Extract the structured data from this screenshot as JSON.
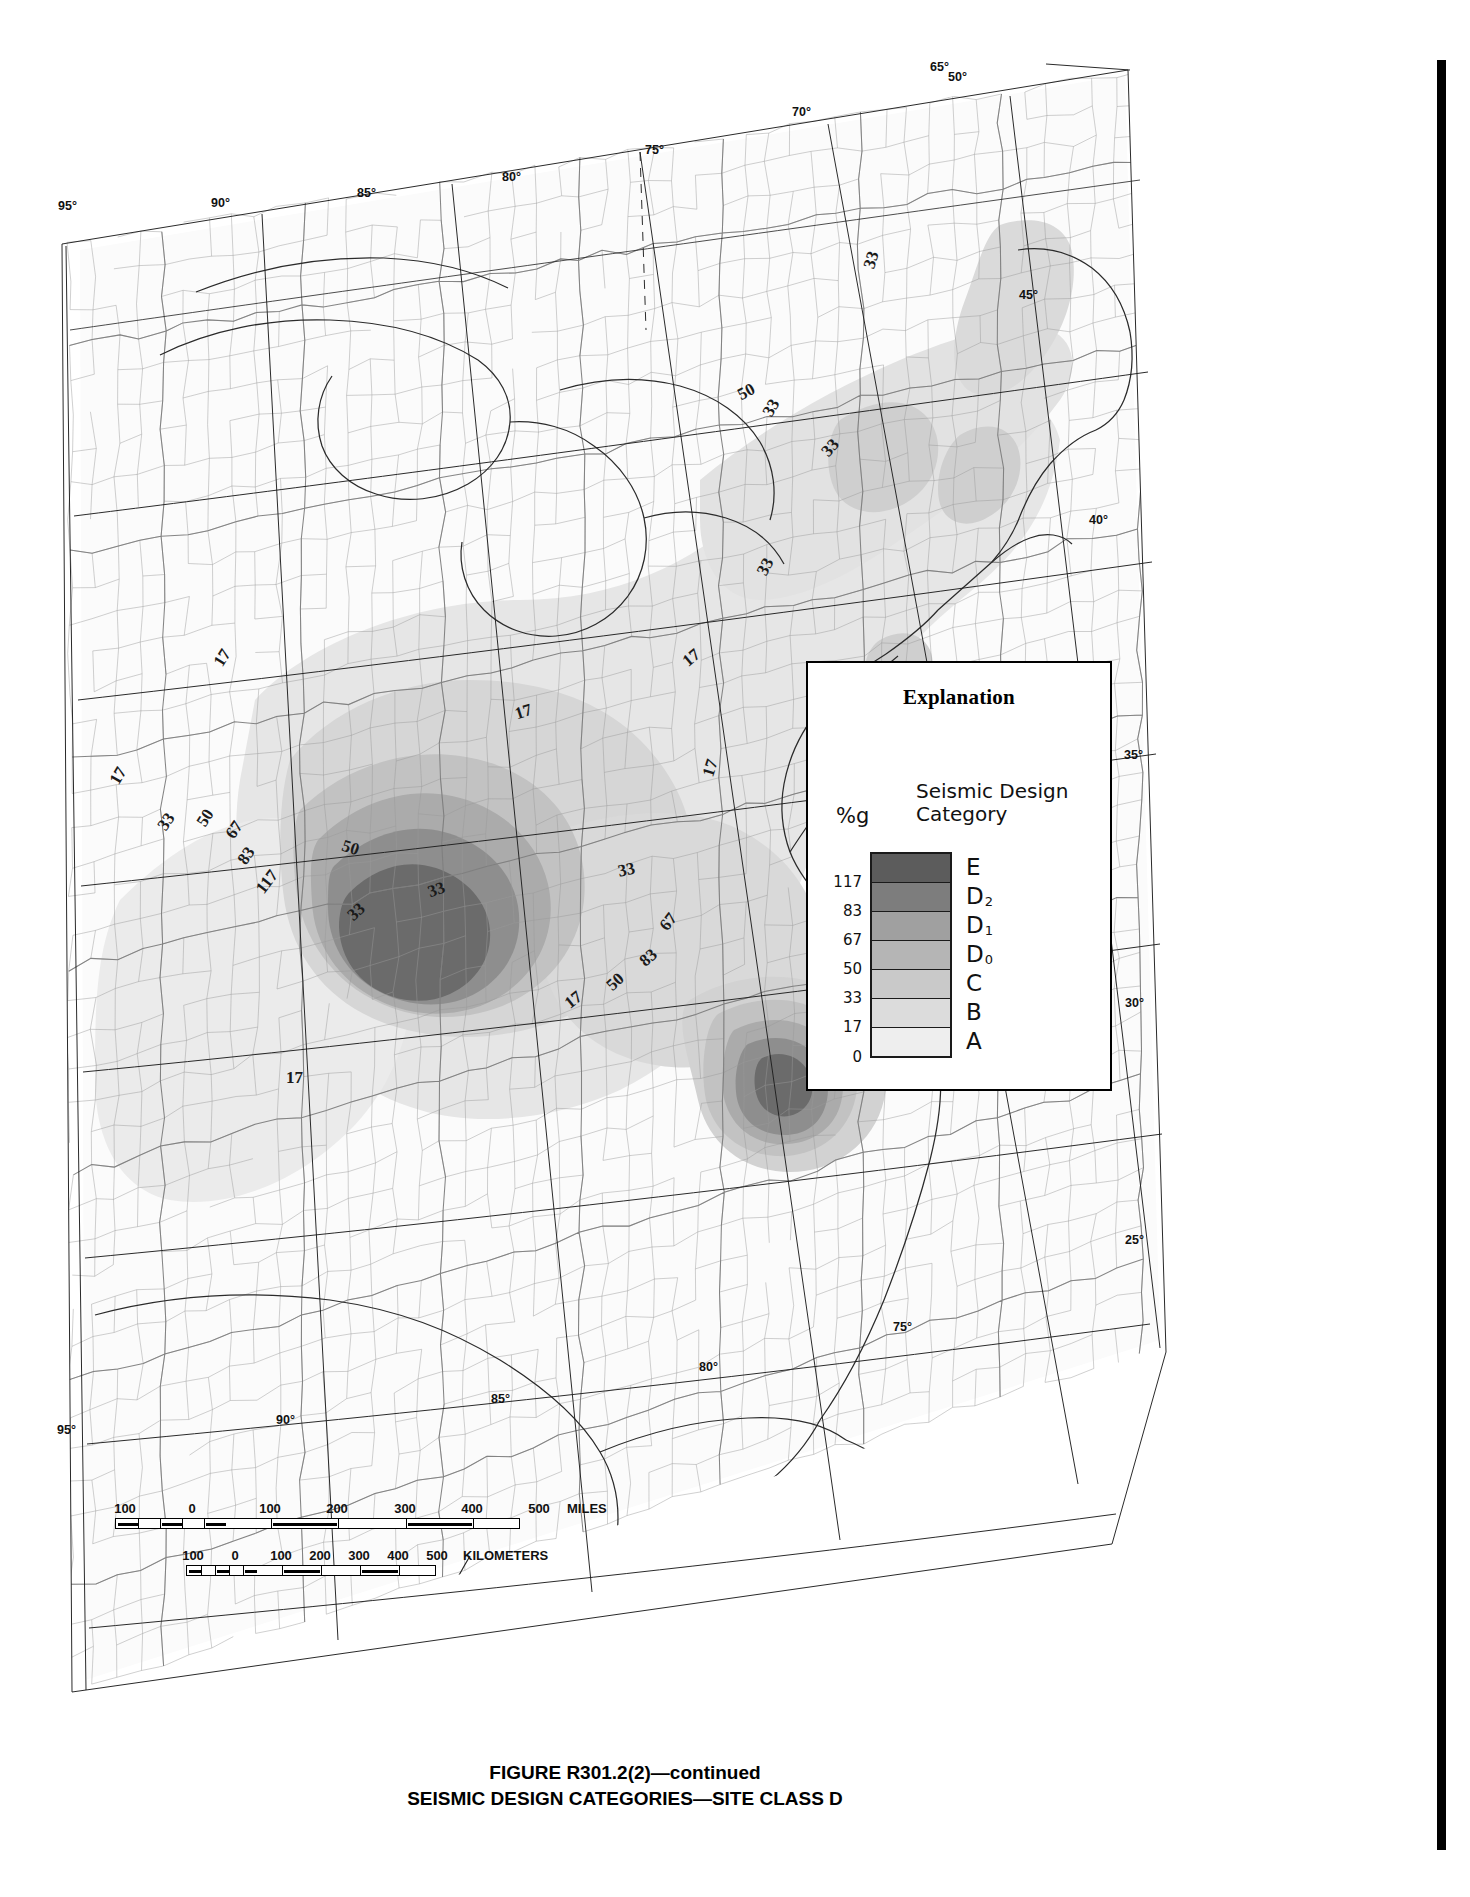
{
  "figure": {
    "caption_line1": "FIGURE R301.2(2)—continued",
    "caption_line2": "SEISMIC DESIGN CATEGORIES—SITE CLASS D"
  },
  "legend": {
    "title": "Explanation",
    "pct_label": "%g",
    "category_header": "Seismic Design\nCategory",
    "ticks": [
      "117",
      "83",
      "67",
      "50",
      "33",
      "17",
      "0"
    ],
    "rows": [
      {
        "category": "E",
        "sub": "",
        "color": "#5c5c5c",
        "upper_tick": ""
      },
      {
        "category": "D",
        "sub": "2",
        "color": "#7d7d7d",
        "upper_tick": "117"
      },
      {
        "category": "D",
        "sub": "1",
        "color": "#a0a0a0",
        "upper_tick": "83"
      },
      {
        "category": "D",
        "sub": "0",
        "color": "#b5b5b5",
        "upper_tick": "67"
      },
      {
        "category": "C",
        "sub": "",
        "color": "#c9c9c9",
        "upper_tick": "50"
      },
      {
        "category": "B",
        "sub": "",
        "color": "#dcdcdc",
        "upper_tick": "33"
      },
      {
        "category": "A",
        "sub": "",
        "color": "#eeeeee",
        "upper_tick": "17"
      }
    ],
    "bottom_tick": "0"
  },
  "scales": {
    "miles": {
      "unit": "MILES",
      "labels": [
        "100",
        "0",
        "100",
        "200",
        "300",
        "400",
        "500"
      ]
    },
    "kilometers": {
      "unit": "KILOMETERS",
      "labels": [
        "100",
        "0",
        "100",
        "200",
        "300",
        "400",
        "500"
      ]
    }
  },
  "graticule": {
    "longitude_top": [
      "95°",
      "90°",
      "85°",
      "80°",
      "75°",
      "70°",
      "65°"
    ],
    "longitude_bottom": [
      "95°",
      "90°",
      "85°",
      "80°",
      "75°"
    ],
    "latitude_right": [
      "50°",
      "45°",
      "40°",
      "35°",
      "30°",
      "25°"
    ]
  },
  "chart_data": {
    "type": "map",
    "title": "SEISMIC DESIGN CATEGORIES—SITE CLASS D",
    "subtitle": "FIGURE R301.2(2)—continued",
    "projection": "conic",
    "region": "Central and Eastern United States",
    "variable": "Spectral response acceleration (% g) / Seismic Design Category",
    "units": "%g",
    "legend_position": "right-center",
    "breaks": [
      0,
      17,
      33,
      50,
      67,
      83,
      117
    ],
    "categories": [
      "A",
      "B",
      "C",
      "D0",
      "D1",
      "D2",
      "E"
    ],
    "category_colors": [
      "#eeeeee",
      "#dcdcdc",
      "#c9c9c9",
      "#b5b5b5",
      "#a0a0a0",
      "#7d7d7d",
      "#5c5c5c"
    ],
    "contour_levels": [
      17,
      33,
      50,
      67,
      83,
      117
    ],
    "contour_labels_on_map": [
      {
        "value": "33",
        "region": "northern Maine"
      },
      {
        "value": "50",
        "region": "Adirondacks / upstate New York"
      },
      {
        "value": "33",
        "region": "eastern New York"
      },
      {
        "value": "33",
        "region": "New England coast"
      },
      {
        "value": "33",
        "region": "New Jersey / New York City"
      },
      {
        "value": "17",
        "region": "Virginia / Chesapeake"
      },
      {
        "value": "17",
        "region": "Carolina coastal plain"
      },
      {
        "value": "17",
        "region": "mid-Atlantic interior"
      },
      {
        "value": "17",
        "region": "Ohio Valley"
      },
      {
        "value": "17",
        "region": "Great Plains / Kansas"
      },
      {
        "value": "33",
        "region": "Missouri / Arkansas outer ring"
      },
      {
        "value": "50",
        "region": "New Madrid outer ring"
      },
      {
        "value": "67",
        "region": "New Madrid ring"
      },
      {
        "value": "83",
        "region": "New Madrid ring"
      },
      {
        "value": "117",
        "region": "New Madrid core"
      },
      {
        "value": "50",
        "region": "Tennessee / Kentucky"
      },
      {
        "value": "33",
        "region": "Mississippi Valley"
      },
      {
        "value": "33",
        "region": "Tennessee Valley"
      },
      {
        "value": "33",
        "region": "Georgia / South Carolina outer"
      },
      {
        "value": "50",
        "region": "Charleston outer ring"
      },
      {
        "value": "67",
        "region": "Charleston ring"
      },
      {
        "value": "83",
        "region": "Charleston core"
      },
      {
        "value": "17",
        "region": "Gulf Coast / Louisiana"
      }
    ],
    "hazard_centers": [
      {
        "name": "New Madrid Seismic Zone",
        "peak_category": "E",
        "peak_value": 117
      },
      {
        "name": "Charleston, South Carolina",
        "peak_category": "E",
        "peak_value": 117
      },
      {
        "name": "Adirondack / La Malbaie trend",
        "peak_category": "C",
        "peak_value": 50
      }
    ],
    "grid": true,
    "xlabel": "Longitude (°W)",
    "ylabel": "Latitude (°N)",
    "xlim": [
      -97,
      -63
    ],
    "ylim": [
      24,
      50
    ]
  }
}
